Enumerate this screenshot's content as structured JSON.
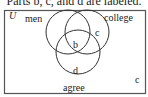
{
  "caption": "Parts b, c, and d are labeled.",
  "diagram": {
    "universe_label": "U",
    "sets": [
      {
        "name": "men"
      },
      {
        "name": "college"
      },
      {
        "name": "agree"
      }
    ],
    "region_labels": {
      "b": "b",
      "c_inner": "c",
      "d": "d",
      "c_outer": "c"
    },
    "colors": {
      "stroke": "#333333",
      "background": "#ffffff"
    }
  }
}
